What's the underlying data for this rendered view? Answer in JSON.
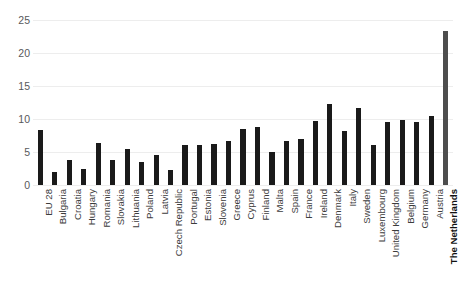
{
  "chart_data": {
    "type": "bar",
    "title": "",
    "subtitle": "",
    "xlabel": "",
    "ylabel": "",
    "ylim": [
      0,
      25
    ],
    "yticks": [
      0,
      5,
      10,
      15,
      20,
      25
    ],
    "grid": true,
    "legend": null,
    "bar_color": "#1a1a1a",
    "highlight_color": "#4d4d4d",
    "highlight_category": "The Netherlands",
    "categories": [
      "EU 28",
      "Bulgaria",
      "Croatia",
      "Hungary",
      "Romania",
      "Slovakia",
      "Lithuania",
      "Poland",
      "Latvia",
      "Czech Republic",
      "Portugal",
      "Estonia",
      "Slovenia",
      "Greece",
      "Cyprus",
      "Finland",
      "Malta",
      "Spain",
      "France",
      "Ireland",
      "Denmark",
      "Italy",
      "Sweden",
      "Luxembourg",
      "United Kingdom",
      "Belgium",
      "Germany",
      "Austria",
      "The Netherlands"
    ],
    "values": [
      8.3,
      2.0,
      3.8,
      2.5,
      6.4,
      3.8,
      5.5,
      3.5,
      4.5,
      2.3,
      6.0,
      6.1,
      6.2,
      6.6,
      8.5,
      8.8,
      5.0,
      6.6,
      7.0,
      9.7,
      12.3,
      8.2,
      11.6,
      6.0,
      9.6,
      9.8,
      9.5,
      10.4,
      23.3
    ]
  }
}
